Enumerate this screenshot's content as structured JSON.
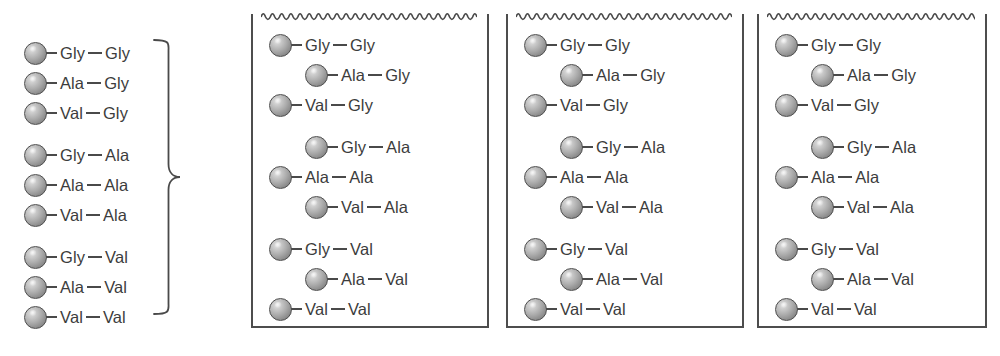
{
  "figure": {
    "residue_bond_symbol": "—",
    "colors": {
      "bead_fill": "#a9a9a9",
      "bead_outline": "#4f4f4f",
      "bond": "#4a4a4a",
      "text": "#3c3c3c",
      "box_border": "#4d4d4d",
      "wave_line": "#4a4a4a",
      "background": "#ffffff"
    }
  },
  "dipeptides": [
    {
      "index": 1,
      "n_terminal": "Gly",
      "c_terminal": "Gly",
      "label": "Gly—Gly",
      "indented": false,
      "group": 1
    },
    {
      "index": 2,
      "n_terminal": "Ala",
      "c_terminal": "Gly",
      "label": "Ala—Gly",
      "indented": true,
      "group": 1
    },
    {
      "index": 3,
      "n_terminal": "Val",
      "c_terminal": "Gly",
      "label": "Val—Gly",
      "indented": false,
      "group": 1
    },
    {
      "index": 4,
      "n_terminal": "Gly",
      "c_terminal": "Ala",
      "label": "Gly—Ala",
      "indented": true,
      "group": 2
    },
    {
      "index": 5,
      "n_terminal": "Ala",
      "c_terminal": "Ala",
      "label": "Ala—Ala",
      "indented": false,
      "group": 2
    },
    {
      "index": 6,
      "n_terminal": "Val",
      "c_terminal": "Ala",
      "label": "Val—Ala",
      "indented": true,
      "group": 2
    },
    {
      "index": 7,
      "n_terminal": "Gly",
      "c_terminal": "Val",
      "label": "Gly—Val",
      "indented": false,
      "group": 3
    },
    {
      "index": 8,
      "n_terminal": "Ala",
      "c_terminal": "Val",
      "label": "Ala—Val",
      "indented": true,
      "group": 3
    },
    {
      "index": 9,
      "n_terminal": "Val",
      "c_terminal": "Val",
      "label": "Val—Val",
      "indented": false,
      "group": 3
    }
  ],
  "panels": [
    {
      "id": "panel-1",
      "name": "brace-panel",
      "boxed": false,
      "has_wave": false,
      "has_brace": true,
      "staggered": false,
      "left": 24,
      "width": 195,
      "row_left": 0,
      "indent_offset": 0,
      "first_row_top": 38,
      "box": null
    },
    {
      "id": "panel-2",
      "name": "resin-bag-1",
      "boxed": true,
      "has_wave": true,
      "has_brace": false,
      "staggered": true,
      "left": 251,
      "width": 238,
      "row_left": 18,
      "indent_offset": 36,
      "first_row_top": 30,
      "box": {
        "top": 14,
        "left": 0,
        "width": 238,
        "height": 314
      }
    },
    {
      "id": "panel-3",
      "name": "resin-bag-2",
      "boxed": true,
      "has_wave": true,
      "has_brace": false,
      "staggered": true,
      "left": 506,
      "width": 238,
      "row_left": 18,
      "indent_offset": 36,
      "first_row_top": 30,
      "box": {
        "top": 14,
        "left": 0,
        "width": 238,
        "height": 314
      }
    },
    {
      "id": "panel-4",
      "name": "resin-bag-3",
      "boxed": true,
      "has_wave": true,
      "has_brace": false,
      "staggered": true,
      "left": 757,
      "width": 230,
      "row_left": 18,
      "indent_offset": 36,
      "first_row_top": 30,
      "box": {
        "top": 14,
        "left": 0,
        "width": 230,
        "height": 314
      }
    }
  ],
  "layout": {
    "row_height": 30,
    "group_gap": 12,
    "brace": {
      "left": 152,
      "top": 38,
      "width": 30,
      "height": 278
    }
  }
}
